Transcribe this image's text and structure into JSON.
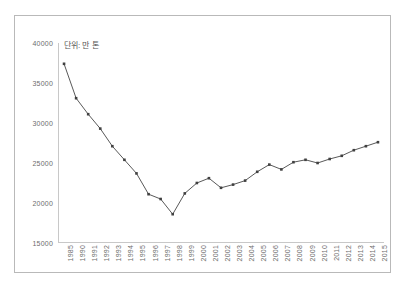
{
  "chart_data": {
    "type": "line",
    "title": "",
    "subtitle": "",
    "annotation": "단위: 만 톤",
    "xlabel": "",
    "ylabel": "",
    "ylim": [
      15000,
      40000
    ],
    "yticks": [
      15000,
      20000,
      25000,
      30000,
      35000,
      40000
    ],
    "ytick_labels": [
      "15000",
      "20000",
      "25000",
      "30000",
      "35000",
      "40000"
    ],
    "grid": false,
    "legend": "none",
    "marker": "square",
    "line_color": "#595959",
    "marker_color": "#404040",
    "categories": [
      "1985",
      "1990",
      "1991",
      "1992",
      "1993",
      "1994",
      "1995",
      "1996",
      "1997",
      "1998",
      "1999",
      "2000",
      "2001",
      "2002",
      "2003",
      "2004",
      "2005",
      "2006",
      "2007",
      "2008",
      "2009",
      "2010",
      "2011",
      "2012",
      "2013",
      "2014",
      "2015"
    ],
    "values": [
      37400,
      33100,
      31100,
      29300,
      27100,
      25400,
      23700,
      21100,
      20500,
      18600,
      21200,
      22500,
      23100,
      21900,
      22300,
      22800,
      23900,
      24800,
      24200,
      25100,
      25400,
      25000,
      25500,
      25900,
      26600,
      27100,
      27600
    ],
    "series": [
      {
        "name": "series-1",
        "values": [
          37400,
          33100,
          31100,
          29300,
          27100,
          25400,
          23700,
          21100,
          20500,
          18600,
          21200,
          22500,
          23100,
          21900,
          22300,
          22800,
          23900,
          24800,
          24200,
          25100,
          25400,
          25000,
          25500,
          25900,
          26600,
          27100,
          27600
        ]
      }
    ]
  },
  "figure": {
    "caption": ""
  }
}
